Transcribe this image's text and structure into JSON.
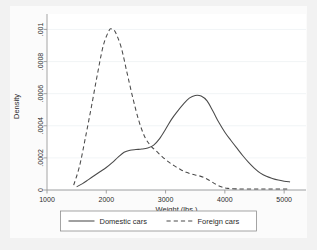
{
  "figure": {
    "background_color": "#f2f2f2",
    "plot_background_color": "#ffffff"
  },
  "chart_data": {
    "type": "line",
    "title": "",
    "subtitle": "",
    "xlabel": "Weight (lbs.)",
    "ylabel": "Density",
    "xlim": [
      1000,
      5200
    ],
    "ylim": [
      0,
      0.00104
    ],
    "xticks": [
      1000,
      2000,
      3000,
      4000,
      5000
    ],
    "xtick_labels": [
      "1000",
      "2000",
      "3000",
      "4000",
      "5000"
    ],
    "yticks": [
      0,
      0.0002,
      0.0004,
      0.0006,
      0.0008,
      0.001
    ],
    "ytick_labels": [
      "0",
      ".0002",
      ".0004",
      ".0006",
      ".0008",
      ".001"
    ],
    "grid": "horizontal-faint",
    "legend_position": "bottom-outside",
    "series": [
      {
        "name": "Domestic cars",
        "style": "solid",
        "color": "#4a4a4a",
        "x": [
          1500,
          1600,
          1700,
          1800,
          1900,
          2000,
          2100,
          2200,
          2300,
          2400,
          2500,
          2600,
          2700,
          2800,
          2900,
          3000,
          3100,
          3200,
          3300,
          3400,
          3500,
          3600,
          3700,
          3800,
          3900,
          4000,
          4100,
          4200,
          4300,
          4400,
          4500,
          4600,
          4700,
          4800,
          4900,
          5000,
          5100
        ],
        "y": [
          2e-05,
          4e-05,
          6.5e-05,
          9e-05,
          0.000115,
          0.00014,
          0.00017,
          0.000205,
          0.000235,
          0.000248,
          0.000252,
          0.000255,
          0.000262,
          0.00028,
          0.00032,
          0.000378,
          0.00044,
          0.00049,
          0.000535,
          0.000572,
          0.000589,
          0.000585,
          0.000555,
          0.00049,
          0.00042,
          0.00036,
          0.00031,
          0.000262,
          0.000215,
          0.000172,
          0.000135,
          0.000105,
          8.5e-05,
          7.2e-05,
          6.2e-05,
          5.5e-05,
          5e-05
        ]
      },
      {
        "name": "Foreign cars",
        "style": "dashed",
        "color": "#4a4a4a",
        "x": [
          1450,
          1550,
          1650,
          1750,
          1850,
          1950,
          2050,
          2100,
          2150,
          2250,
          2350,
          2450,
          2550,
          2650,
          2750,
          2850,
          2950,
          3050,
          3150,
          3250,
          3350,
          3450,
          3550,
          3650,
          3750,
          3850,
          3950,
          4050,
          4200,
          4400,
          4600,
          4800,
          5000,
          5100
        ],
        "y": [
          3e-05,
          0.00015,
          0.00033,
          0.00052,
          0.00072,
          0.0009,
          0.000995,
          0.001,
          0.000985,
          0.00089,
          0.00073,
          0.00057,
          0.00043,
          0.00033,
          0.000275,
          0.00024,
          0.000205,
          0.000175,
          0.00015,
          0.000128,
          0.00011,
          9.8e-05,
          9e-05,
          7.8e-05,
          5.8e-05,
          3.5e-05,
          1.8e-05,
          1e-05,
          7e-06,
          6e-06,
          6e-06,
          6e-06,
          6e-06,
          6e-06
        ]
      }
    ]
  },
  "legend": {
    "entries": [
      {
        "label": "Domestic cars",
        "style": "solid"
      },
      {
        "label": "Foreign cars",
        "style": "dashed"
      }
    ]
  }
}
